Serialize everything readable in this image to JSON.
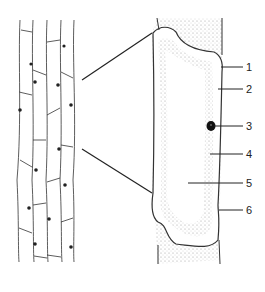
{
  "diagram": {
    "labels": [
      {
        "num": "1",
        "y": 67
      },
      {
        "num": "2",
        "y": 89
      },
      {
        "num": "3",
        "y": 126
      },
      {
        "num": "4",
        "y": 154
      },
      {
        "num": "5",
        "y": 183
      },
      {
        "num": "6",
        "y": 210
      }
    ],
    "colors": {
      "line": "#222222",
      "stipple": "#9a9a9a",
      "background": "#ffffff"
    }
  }
}
